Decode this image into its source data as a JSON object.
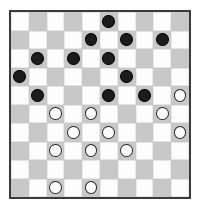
{
  "board": {
    "title": "Checkers board",
    "variant": "international-draughts",
    "columns": 10,
    "rows": 10,
    "colors": {
      "light_square": "#fdfdfd",
      "dark_square": "#c8c8c8",
      "border": "#3a3a3a",
      "black_piece": "#1c1c1c",
      "white_piece": "#fcfcfc",
      "white_piece_outline": "#2b2b2b",
      "background": "#ffffff"
    },
    "square_shades": [
      [
        "light",
        "dark",
        "light",
        "dark",
        "light",
        "dark",
        "light",
        "dark",
        "light",
        "dark"
      ],
      [
        "dark",
        "light",
        "dark",
        "light",
        "dark",
        "light",
        "dark",
        "light",
        "dark",
        "light"
      ],
      [
        "light",
        "dark",
        "light",
        "dark",
        "light",
        "dark",
        "light",
        "dark",
        "light",
        "dark"
      ],
      [
        "dark",
        "light",
        "dark",
        "light",
        "dark",
        "light",
        "dark",
        "light",
        "dark",
        "light"
      ],
      [
        "light",
        "dark",
        "light",
        "dark",
        "light",
        "dark",
        "light",
        "dark",
        "light",
        "dark"
      ],
      [
        "dark",
        "light",
        "dark",
        "light",
        "dark",
        "light",
        "dark",
        "light",
        "dark",
        "light"
      ],
      [
        "light",
        "dark",
        "light",
        "dark",
        "light",
        "dark",
        "light",
        "dark",
        "light",
        "dark"
      ],
      [
        "dark",
        "light",
        "dark",
        "light",
        "dark",
        "light",
        "dark",
        "light",
        "dark",
        "light"
      ],
      [
        "light",
        "dark",
        "light",
        "dark",
        "light",
        "dark",
        "light",
        "dark",
        "light",
        "dark"
      ],
      [
        "dark",
        "light",
        "dark",
        "light",
        "dark",
        "light",
        "dark",
        "light",
        "dark",
        "light"
      ]
    ],
    "pieces": [
      [
        "",
        "",
        "",
        "",
        "",
        "black",
        "",
        "",
        "",
        ""
      ],
      [
        "",
        "",
        "",
        "",
        "black",
        "",
        "black",
        "",
        "black",
        ""
      ],
      [
        "",
        "black",
        "",
        "black",
        "",
        "black",
        "",
        "",
        "",
        ""
      ],
      [
        "black",
        "",
        "",
        "",
        "",
        "",
        "black",
        "",
        "",
        ""
      ],
      [
        "",
        "black",
        "",
        "",
        "",
        "black",
        "",
        "black",
        "",
        "white"
      ],
      [
        "",
        "",
        "white",
        "",
        "white",
        "",
        "",
        "",
        "white",
        ""
      ],
      [
        "",
        "",
        "",
        "white",
        "",
        "white",
        "",
        "",
        "",
        "white"
      ],
      [
        "",
        "",
        "white",
        "",
        "white",
        "",
        "white",
        "",
        "",
        ""
      ],
      [
        "",
        "",
        "",
        "",
        "",
        "",
        "",
        "",
        "",
        ""
      ],
      [
        "",
        "",
        "white",
        "",
        "white",
        "",
        "",
        "",
        "",
        ""
      ]
    ],
    "counts": {
      "black_pieces": 14,
      "white_pieces": 11,
      "black_label": "Black",
      "white_label": "White"
    }
  }
}
